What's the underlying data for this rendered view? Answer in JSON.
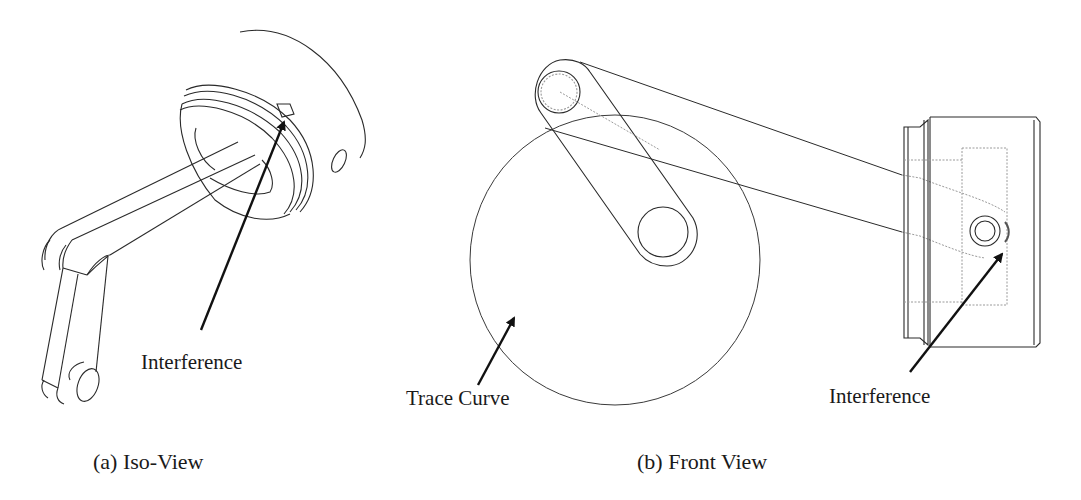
{
  "figure": {
    "panels": [
      {
        "id": "a",
        "caption": "(a) Iso-View",
        "annotations": [
          {
            "text": "Interference"
          }
        ]
      },
      {
        "id": "b",
        "caption": "(b) Front View",
        "annotations": [
          {
            "text": "Trace Curve"
          },
          {
            "text": "Interference"
          }
        ]
      }
    ],
    "colors": {
      "line": "#2a2a2a",
      "hidden_line": "#9a9a9a",
      "arrow": "#111111",
      "background": "#ffffff"
    }
  }
}
